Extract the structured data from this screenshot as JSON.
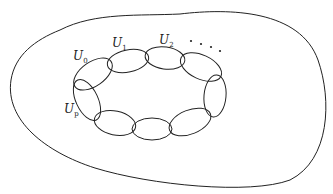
{
  "diagram": {
    "title": "",
    "labels": [
      {
        "id": "U0",
        "base": "U",
        "sub": "0",
        "x": 75,
        "y": 57
      },
      {
        "id": "U1",
        "base": "U",
        "sub": "1",
        "x": 112,
        "y": 45
      },
      {
        "id": "U2",
        "base": "U",
        "sub": "2",
        "x": 159,
        "y": 43
      },
      {
        "id": "Up",
        "base": "U",
        "sub": "p",
        "x": 64,
        "y": 113
      }
    ],
    "ellipsis": "· · · ·",
    "colors": {
      "stroke": "#222222",
      "background": "#ffffff"
    }
  }
}
